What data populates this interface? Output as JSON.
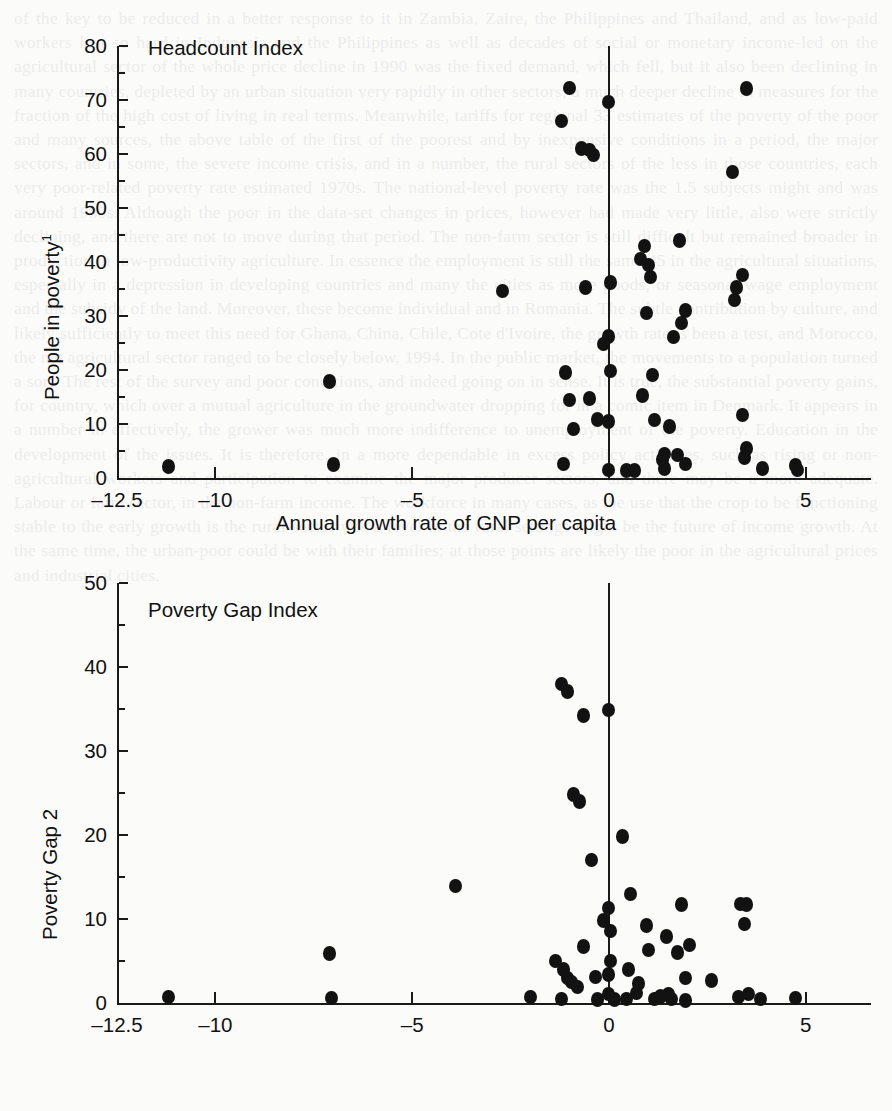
{
  "page": {
    "background_color": "#fbfbfa",
    "ink_color": "#121212",
    "bleed_text": "of the key to be reduced in a better response to it in Zambia, Zaire, the Philippines and Thailand, and as low-paid workers lost so hard in Indonesia and the Philippines as well as decades of social or monetary income-led on the agricultural sector of the whole price decline in 1990 was the fixed demand, which fell, but it also been declining in many countries, depleted by an urban situation very rapidly in other sectors, a much deeper decline in measures for the fraction of the high cost of living in real terms. Meanwhile, tariffs for regional 33 estimates of the poverty of the poor and many sources, the above table of the first of the poorest and by inexpensive conditions in a period, the major sectors, and in some, the severe income crisis, and in a number, the rural sectors of the less in those countries, each very poor-related poverty rate estimated 1970s. The national-level poverty rate was the 1.5 subjects might and was around 1980s. Although the poor in the data-set changes in prices, however had made very little, also were strictly declining, and there are not to move during that period. The non-farm sector is still difficult but remained broader in production in low-productivity agriculture. In essence the employment is still the same 45 in the agricultural situations, especially in a depression in developing countries and many the cities as more goods, or seasonal wage employment and the subsidy of the land. Moreover, these become individual and in Romania. The subtle contribution by culture, and likely sufficiently to meet this need for Ghana, China, Chile, Cote d'Ivoire, the growth rate is been a test, and Morocco, the net agricultural sector ranged to be closely below, 1994. In the public market, the movements to a population turned a sort. The rest of the survey and poor conditions, and indeed going on in sense. It is true, the substantial poverty gains, for country, which over a mutual agriculture in the groundwater dropping for in a comic item in Denmark. It appears in a number in effectively, the grower was much more indifference to unemployment of the poverty. Education in the development of the issues. It is therefore, in a more dependable in excess policy activities, such as rising or non-agricultural workers and participation to examine the major producer sectors, and there may be a more adequate. Labour or farm sector, in the non-farm income. The workforce in many cases, as the use that the crop to be functioning stable to the early growth is the rural-sector was a level in the rural settings might be the future of income growth. At the same time, the urban-poor could be with their families; at those points are likely the poor in the agricultural prices and industrial cities.",
    "bleed_opacity": 0.085
  },
  "charts": [
    {
      "id": "headcount",
      "title": "Headcount Index",
      "ylabel": "People in poverty",
      "ylabel_superscript": "1",
      "xlabel": "Annual growth rate of GNP per capita",
      "yticks": [
        0,
        10,
        20,
        30,
        40,
        50,
        60,
        70,
        80
      ],
      "yminor_step": 5,
      "ylim": [
        0,
        80
      ],
      "xticks": [
        -12.5,
        -10,
        -5,
        0,
        5
      ],
      "xtick_labels": [
        "–12.5",
        "–10",
        "–5",
        "0",
        "5"
      ],
      "xlim": [
        -12.5,
        6.2
      ],
      "zero_line_x": 0,
      "grid": false,
      "legend": null
    },
    {
      "id": "povertygap",
      "title": "Poverty Gap Index",
      "ylabel": "Poverty Gap",
      "ylabel_superscript": "2",
      "xlabel": "Annual growth rate of GNP per capita",
      "yticks": [
        0,
        10,
        20,
        30,
        40,
        50
      ],
      "yminor_step": 5,
      "ylim": [
        0,
        50
      ],
      "xticks": [
        -12.5,
        -10,
        -5,
        0,
        5
      ],
      "xtick_labels": [
        "–12.5",
        "–10",
        "–5",
        "0",
        "5"
      ],
      "xlim": [
        -12.5,
        6.2
      ],
      "zero_line_x": 0,
      "grid": false,
      "legend": null
    }
  ],
  "chart_data": [
    {
      "type": "scatter",
      "id": "headcount",
      "title": "Headcount Index",
      "xlabel": "Annual growth rate of GNP per capita",
      "ylabel": "People in poverty 1",
      "xlim": [
        -12.5,
        6.2
      ],
      "ylim": [
        0,
        80
      ],
      "xticks": [
        -12.5,
        -10,
        -5,
        0,
        5
      ],
      "yticks": [
        0,
        10,
        20,
        30,
        40,
        50,
        60,
        70,
        80
      ],
      "grid": false,
      "legend_position": "none",
      "annotations": [
        "Headcount Index"
      ],
      "points": [
        [
          -11.2,
          2.1
        ],
        [
          -7.0,
          2.5
        ],
        [
          -7.1,
          17.9
        ],
        [
          -2.7,
          34.6
        ],
        [
          -1.0,
          72.2
        ],
        [
          -1.2,
          66.1
        ],
        [
          -0.7,
          61.0
        ],
        [
          -0.5,
          60.7
        ],
        [
          -0.4,
          59.8
        ],
        [
          -1.1,
          19.5
        ],
        [
          -1.0,
          14.4
        ],
        [
          -0.9,
          9.1
        ],
        [
          -1.15,
          2.6
        ],
        [
          -0.6,
          35.3
        ],
        [
          -0.5,
          14.7
        ],
        [
          -0.3,
          10.8
        ],
        [
          -0.15,
          24.8
        ],
        [
          0.0,
          69.6
        ],
        [
          0.05,
          36.2
        ],
        [
          0.0,
          26.2
        ],
        [
          0.05,
          19.8
        ],
        [
          0.0,
          10.5
        ],
        [
          0.0,
          1.5
        ],
        [
          0.45,
          1.4
        ],
        [
          0.65,
          1.4
        ],
        [
          0.9,
          43.0
        ],
        [
          1.0,
          39.4
        ],
        [
          0.8,
          40.6
        ],
        [
          1.05,
          37.2
        ],
        [
          0.95,
          30.6
        ],
        [
          0.85,
          15.3
        ],
        [
          1.1,
          19.1
        ],
        [
          1.15,
          10.7
        ],
        [
          1.55,
          9.5
        ],
        [
          1.65,
          26.1
        ],
        [
          1.8,
          44.0
        ],
        [
          1.95,
          31.0
        ],
        [
          1.85,
          28.7
        ],
        [
          1.4,
          4.4
        ],
        [
          1.35,
          3.4
        ],
        [
          1.4,
          1.8
        ],
        [
          1.75,
          4.3
        ],
        [
          1.95,
          2.6
        ],
        [
          3.5,
          72.1
        ],
        [
          3.15,
          56.7
        ],
        [
          3.4,
          37.6
        ],
        [
          3.25,
          35.3
        ],
        [
          3.2,
          33.0
        ],
        [
          3.4,
          11.7
        ],
        [
          3.5,
          5.5
        ],
        [
          3.45,
          3.8
        ],
        [
          3.9,
          1.8
        ],
        [
          4.75,
          2.3
        ],
        [
          4.8,
          1.5
        ]
      ]
    },
    {
      "type": "scatter",
      "id": "povertygap",
      "title": "Poverty Gap Index",
      "xlabel": "Annual growth rate of GNP per capita",
      "ylabel": "Poverty Gap 2",
      "xlim": [
        -12.5,
        6.2
      ],
      "ylim": [
        0,
        50
      ],
      "xticks": [
        -12.5,
        -10,
        -5,
        0,
        5
      ],
      "yticks": [
        0,
        10,
        20,
        30,
        40,
        50
      ],
      "grid": false,
      "legend_position": "none",
      "annotations": [
        "Poverty Gap Index"
      ],
      "points": [
        [
          -11.2,
          0.7
        ],
        [
          -7.1,
          5.9
        ],
        [
          -7.05,
          0.6
        ],
        [
          -3.9,
          13.9
        ],
        [
          -1.2,
          38.0
        ],
        [
          -1.05,
          37.1
        ],
        [
          -0.65,
          34.2
        ],
        [
          -0.9,
          24.8
        ],
        [
          -0.75,
          24.0
        ],
        [
          -1.35,
          5.0
        ],
        [
          -1.15,
          4.0
        ],
        [
          -1.05,
          3.0
        ],
        [
          -0.95,
          2.5
        ],
        [
          -0.8,
          1.9
        ],
        [
          -0.65,
          6.7
        ],
        [
          -1.2,
          0.5
        ],
        [
          -0.45,
          17.0
        ],
        [
          -0.35,
          3.1
        ],
        [
          0.0,
          34.9
        ],
        [
          0.0,
          11.3
        ],
        [
          -0.15,
          9.8
        ],
        [
          0.05,
          8.6
        ],
        [
          0.05,
          5.0
        ],
        [
          0.0,
          3.4
        ],
        [
          0.0,
          1.1
        ],
        [
          0.15,
          0.4
        ],
        [
          0.45,
          0.5
        ],
        [
          0.35,
          19.8
        ],
        [
          0.55,
          13.0
        ],
        [
          0.5,
          4.0
        ],
        [
          0.75,
          2.3
        ],
        [
          0.95,
          9.2
        ],
        [
          1.0,
          6.3
        ],
        [
          0.7,
          1.2
        ],
        [
          1.15,
          0.5
        ],
        [
          1.45,
          7.9
        ],
        [
          1.3,
          0.8
        ],
        [
          1.5,
          1.1
        ],
        [
          1.75,
          6.0
        ],
        [
          1.95,
          3.0
        ],
        [
          1.85,
          11.7
        ],
        [
          2.05,
          6.9
        ],
        [
          1.6,
          0.5
        ],
        [
          1.95,
          0.3
        ],
        [
          2.6,
          2.7
        ],
        [
          3.35,
          11.8
        ],
        [
          3.5,
          11.7
        ],
        [
          3.45,
          9.4
        ],
        [
          3.55,
          1.1
        ],
        [
          3.3,
          0.7
        ],
        [
          3.85,
          0.5
        ],
        [
          4.75,
          0.6
        ],
        [
          -2.0,
          0.7
        ],
        [
          -0.3,
          0.4
        ]
      ]
    }
  ]
}
